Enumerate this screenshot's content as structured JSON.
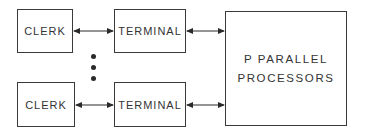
{
  "diagram": {
    "rows": [
      {
        "clerk": "CLERK",
        "terminal": "TERMINAL"
      },
      {
        "clerk": "CLERK",
        "terminal": "TERMINAL"
      }
    ],
    "processor": {
      "line1": "P PARALLEL",
      "line2": "PROCESSORS"
    },
    "ellipsis": "vertical-dots",
    "connections": [
      {
        "from": "clerk-1",
        "to": "terminal-1",
        "type": "bidirectional-arrow"
      },
      {
        "from": "terminal-1",
        "to": "processors",
        "type": "bidirectional-arrow"
      },
      {
        "from": "clerk-2",
        "to": "terminal-2",
        "type": "bidirectional-arrow"
      },
      {
        "from": "terminal-2",
        "to": "processors",
        "type": "bidirectional-arrow"
      }
    ]
  }
}
